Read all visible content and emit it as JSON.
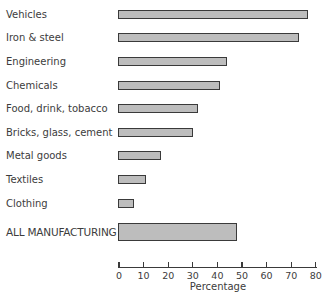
{
  "chart_data": {
    "type": "bar",
    "orientation": "horizontal",
    "title": "",
    "xlabel": "Percentage",
    "ylabel": "",
    "xlim": [
      0,
      80
    ],
    "xticks": [
      0,
      10,
      20,
      30,
      40,
      50,
      60,
      70,
      80
    ],
    "grid": false,
    "legend": null,
    "categories": [
      "Vehicles",
      "Iron & steel",
      "Engineering",
      "Chemicals",
      "Food, drink, tobacco",
      "Bricks, glass, cement",
      "Metal goods",
      "Textiles",
      "Clothing",
      "ALL MANUFACTURING"
    ],
    "values": [
      77,
      73,
      44,
      41,
      32,
      30,
      17,
      11,
      6,
      48
    ]
  },
  "axis": {
    "xlabel": "Percentage",
    "ticks": [
      "0",
      "10",
      "20",
      "30",
      "40",
      "50",
      "60",
      "70",
      "80"
    ]
  },
  "rows": [
    {
      "label": "Vehicles",
      "value": 77
    },
    {
      "label": "Iron & steel",
      "value": 73
    },
    {
      "label": "Engineering",
      "value": 44
    },
    {
      "label": "Chemicals",
      "value": 41
    },
    {
      "label": "Food, drink, tobacco",
      "value": 32
    },
    {
      "label": "Bricks, glass, cement",
      "value": 30
    },
    {
      "label": "Metal goods",
      "value": 17
    },
    {
      "label": "Textiles",
      "value": 11
    },
    {
      "label": "Clothing",
      "value": 6
    },
    {
      "label": "ALL MANUFACTURING",
      "value": 48
    }
  ],
  "colors": {
    "bar_fill": "#bdbdbd",
    "bar_border": "#3a3a3a",
    "text": "#3c3c3c"
  }
}
